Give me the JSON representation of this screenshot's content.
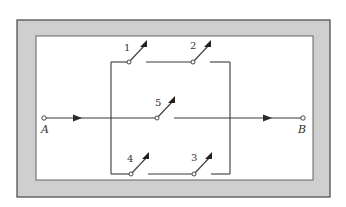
{
  "diagram": {
    "type": "switch-network",
    "terminals": {
      "start": "A",
      "end": "B"
    },
    "switches": [
      {
        "id": "1",
        "label": "1",
        "branch": "top",
        "state": "open"
      },
      {
        "id": "2",
        "label": "2",
        "branch": "top",
        "state": "open"
      },
      {
        "id": "5",
        "label": "5",
        "branch": "middle",
        "state": "open"
      },
      {
        "id": "4",
        "label": "4",
        "branch": "bottom",
        "state": "open"
      },
      {
        "id": "3",
        "label": "3",
        "branch": "bottom",
        "state": "open"
      }
    ],
    "colors": {
      "frame": "#cfcfcf",
      "frame_edge": "#444444",
      "wire": "#3a3a3a",
      "background": "#ffffff"
    }
  }
}
